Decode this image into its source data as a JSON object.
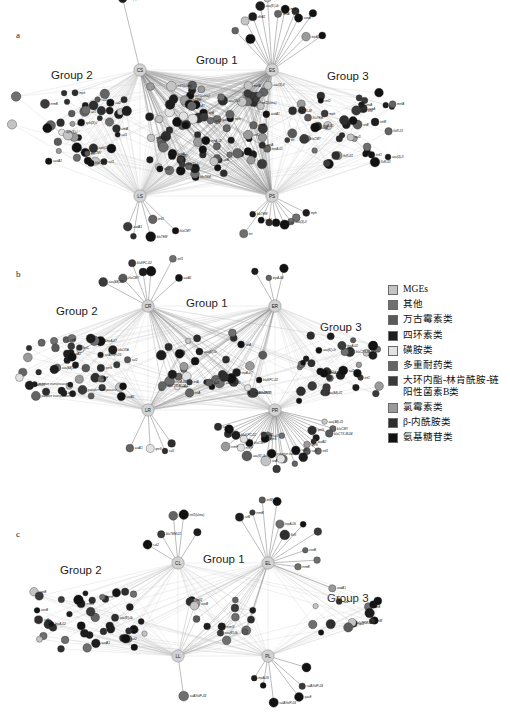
{
  "figure": {
    "panels": [
      {
        "letter": "a",
        "hubs": [
          "CS",
          "ES",
          "LS",
          "PS"
        ],
        "groups": [
          "Group 1",
          "Group 2",
          "Group 3"
        ]
      },
      {
        "letter": "b",
        "hubs": [
          "CR",
          "ER",
          "LR",
          "PR"
        ],
        "groups": [
          "Group 1",
          "Group 2",
          "Group 3"
        ]
      },
      {
        "letter": "c",
        "hubs": [
          "CL",
          "EL",
          "LL",
          "PL"
        ],
        "groups": [
          "Group 1",
          "Group 2",
          "Group 3"
        ]
      }
    ]
  },
  "legend": {
    "items": [
      {
        "label": "MGEs",
        "color": "#c4c4c4"
      },
      {
        "label": "其他",
        "color": "#6f6f6f"
      },
      {
        "label": "万古霉素类",
        "color": "#5a5a5a"
      },
      {
        "label": "四环素类",
        "color": "#1d1d1d"
      },
      {
        "label": "磺胺类",
        "color": "#e2e2e2"
      },
      {
        "label": "多重耐药类",
        "color": "#646464"
      },
      {
        "label": "大环内酯-林肯酰胺-链阳性菌素B类",
        "color": "#3a3a3a"
      },
      {
        "label": "氯霉素类",
        "color": "#9a9a9a"
      },
      {
        "label": "β-内酰胺类",
        "color": "#2e2e2e"
      },
      {
        "label": "氨基糖苷类",
        "color": "#121212"
      }
    ]
  },
  "genes": {
    "panel_a": [
      "tnpA-01",
      "blaCMY",
      "blaCTX-M",
      "tet",
      "floR-01",
      "sul1",
      "qacE",
      "intI1(clinic)",
      "aac(6')-Ib",
      "aac(4)-02",
      "ermB",
      "sul2",
      "mefA",
      "strB",
      "dfrA1",
      "mph",
      "aadA1",
      "aac(3)-II",
      "vanA",
      "cmlA",
      "tetM",
      "tetO",
      "blaTEM",
      "aph(3')-I",
      "sul3"
    ],
    "panel_b": [
      "blaCMY",
      "blaOXA",
      "blaCTX-M-04",
      "blaKPC-02",
      "aac(6')-Ib",
      "aac(44)-01",
      "sul1",
      "sul2",
      "dfrA1",
      "tnpA-02",
      "tnpA-04",
      "tnpA-07",
      "sulA/folP-03",
      "putative transposase",
      "tetA",
      "tetC",
      "ermF",
      "qnrS",
      "intI1",
      "floR-01",
      "strA",
      "aadA2",
      "catA1",
      "tetW"
    ],
    "panel_c": [
      "tnpA-02",
      "tnpA-03",
      "tnpA-05",
      "ermTR",
      "intI1(clinic)",
      "qacE",
      "sul1",
      "sul2",
      "sulA/folP-03",
      "tetM",
      "tetQ",
      "blaTEM-01",
      "aac(6')-Ib",
      "aadA1",
      "mexF",
      "ermB",
      "ermG",
      "floR",
      "vanB",
      "strB"
    ]
  }
}
